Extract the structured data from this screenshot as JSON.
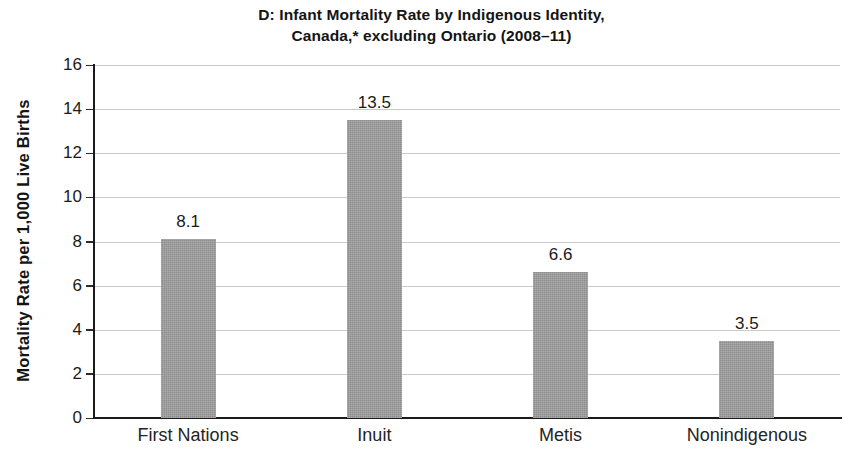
{
  "chart_data": {
    "type": "bar",
    "title": "D: Infant Mortality Rate by Indigenous Identity, Canada,* excluding Ontario (2008–11)",
    "title_lines": [
      "D: Infant Mortality Rate by Indigenous Identity,",
      "Canada,* excluding Ontario (2008–11)"
    ],
    "categories": [
      "First Nations",
      "Inuit",
      "Metis",
      "Nonindigenous"
    ],
    "values": [
      8.1,
      13.5,
      6.6,
      3.5
    ],
    "value_labels": [
      "8.1",
      "13.5",
      "6.6",
      "3.5"
    ],
    "xlabel": "",
    "ylabel": "Mortality Rate per 1,000 Live Births",
    "ylim": [
      0,
      16
    ],
    "ytick_values": [
      0,
      2,
      4,
      6,
      8,
      10,
      12,
      14,
      16
    ],
    "ytick_labels": [
      "0",
      "2",
      "4",
      "6",
      "8",
      "10",
      "12",
      "14",
      "16"
    ],
    "grid": true,
    "grid_axis": "y",
    "legend": false,
    "legend_position": "none",
    "bar_color": "#9b9b9b",
    "axis_color": "#1a1a1a",
    "gridline_color": "#c9c9c9",
    "text_color": "#1a1a1a",
    "background_color": "#ffffff"
  }
}
